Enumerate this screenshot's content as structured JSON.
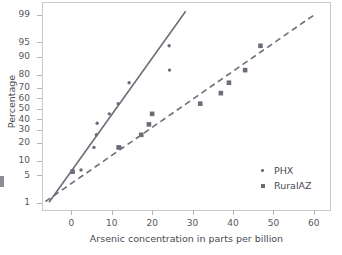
{
  "chart_data": {
    "type": "scatter",
    "title": "",
    "subtitle": "",
    "xlabel": "Arsenic concentration in parts per billion",
    "ylabel": "Percentage",
    "xlim": [
      -7,
      64
    ],
    "ylim_percent": [
      0.6,
      99.6
    ],
    "yscale": "normal-probability",
    "grid": false,
    "legend_position": "inside-bottom-right",
    "xticks": [
      0,
      10,
      20,
      30,
      40,
      50,
      60
    ],
    "yticks": [
      1,
      5,
      10,
      20,
      30,
      40,
      50,
      60,
      70,
      80,
      90,
      95,
      99
    ],
    "xtick_labels": [
      "0",
      "10",
      "20",
      "30",
      "40",
      "50",
      "60"
    ],
    "ytick_labels": [
      "1",
      "5",
      "10",
      "20",
      "30",
      "40",
      "50",
      "60",
      "70",
      "80",
      "90",
      "95",
      "99"
    ],
    "series": [
      {
        "name": "PHX",
        "marker": "dot",
        "color": "#6d6d79",
        "line_style": "solid",
        "points": [
          {
            "x": 0.4,
            "y": 6
          },
          {
            "x": 2.4,
            "y": 6.5
          },
          {
            "x": 5.6,
            "y": 17
          },
          {
            "x": 6.2,
            "y": 26
          },
          {
            "x": 6.4,
            "y": 36
          },
          {
            "x": 9.4,
            "y": 45
          },
          {
            "x": 11.6,
            "y": 55
          },
          {
            "x": 12.1,
            "y": 17
          },
          {
            "x": 14.3,
            "y": 74
          },
          {
            "x": 24.2,
            "y": 94
          },
          {
            "x": 24.3,
            "y": 83
          }
        ],
        "fit_line": {
          "x1": -5.5,
          "y1": 1.05,
          "x2": 28.3,
          "y2": 99.2
        }
      },
      {
        "name": "RuralAZ",
        "marker": "square",
        "color": "#6d6d79",
        "line_style": "dashed",
        "points": [
          {
            "x": 0.3,
            "y": 6
          },
          {
            "x": 11.7,
            "y": 17
          },
          {
            "x": 17.3,
            "y": 26
          },
          {
            "x": 19.2,
            "y": 35
          },
          {
            "x": 20.0,
            "y": 45
          },
          {
            "x": 31.9,
            "y": 55
          },
          {
            "x": 37.0,
            "y": 65
          },
          {
            "x": 39.0,
            "y": 74
          },
          {
            "x": 43.0,
            "y": 83
          },
          {
            "x": 46.8,
            "y": 94
          }
        ],
        "fit_line": {
          "x1": -6.4,
          "y1": 1.1,
          "x2": 60.2,
          "y2": 99.0
        }
      }
    ]
  },
  "legend": {
    "items": [
      {
        "label": "PHX",
        "marker": "dot"
      },
      {
        "label": "RuralAZ",
        "marker": "square"
      }
    ]
  }
}
